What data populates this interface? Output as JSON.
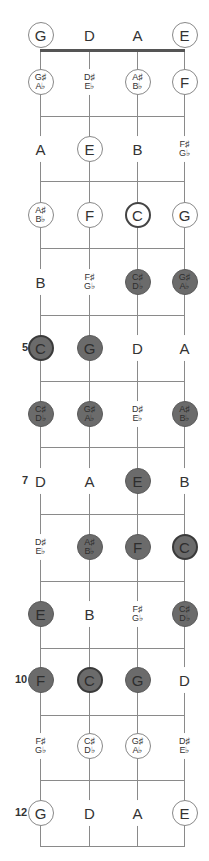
{
  "diagram": {
    "strings": [
      "G",
      "D",
      "A",
      "E"
    ],
    "string_x": [
      40,
      89,
      137,
      184
    ],
    "nut_y": 50,
    "fret_y": [
      116,
      181,
      248,
      315,
      381,
      447,
      514,
      581,
      648,
      715,
      780,
      846
    ],
    "row_y": [
      35,
      82,
      149,
      215,
      282,
      348,
      414,
      481,
      547,
      614,
      680,
      746,
      813
    ],
    "fret_numbers": [
      {
        "fret": 5,
        "label": "5"
      },
      {
        "fret": 7,
        "label": "7"
      },
      {
        "fret": 10,
        "label": "10"
      },
      {
        "fret": 12,
        "label": "12"
      }
    ],
    "colors": {
      "filled": "#6b6b6b",
      "line": "#8a8a8a",
      "nut": "#555555"
    },
    "rows": [
      [
        {
          "t": [
            "G"
          ],
          "s": "outline"
        },
        {
          "t": [
            "D"
          ],
          "s": "plain"
        },
        {
          "t": [
            "A"
          ],
          "s": "plain"
        },
        {
          "t": [
            "E"
          ],
          "s": "outline"
        }
      ],
      [
        {
          "t": [
            "G♯",
            "A♭"
          ],
          "s": "outline"
        },
        {
          "t": [
            "D♯",
            "E♭"
          ],
          "s": "plain"
        },
        {
          "t": [
            "A♯",
            "B♭"
          ],
          "s": "outline"
        },
        {
          "t": [
            "F"
          ],
          "s": "outline"
        }
      ],
      [
        {
          "t": [
            "A"
          ],
          "s": "plain"
        },
        {
          "t": [
            "E"
          ],
          "s": "outline"
        },
        {
          "t": [
            "B"
          ],
          "s": "plain"
        },
        {
          "t": [
            "F♯",
            "G♭"
          ],
          "s": "plain"
        }
      ],
      [
        {
          "t": [
            "A♯",
            "B♭"
          ],
          "s": "outline"
        },
        {
          "t": [
            "F"
          ],
          "s": "outline"
        },
        {
          "t": [
            "C"
          ],
          "s": "root-outline"
        },
        {
          "t": [
            "G"
          ],
          "s": "outline"
        }
      ],
      [
        {
          "t": [
            "B"
          ],
          "s": "plain"
        },
        {
          "t": [
            "F♯",
            "G♭"
          ],
          "s": "plain"
        },
        {
          "t": [
            "C♯",
            "D♭"
          ],
          "s": "filled"
        },
        {
          "t": [
            "G♯",
            "A♭"
          ],
          "s": "filled"
        }
      ],
      [
        {
          "t": [
            "C"
          ],
          "s": "filled root"
        },
        {
          "t": [
            "G"
          ],
          "s": "filled"
        },
        {
          "t": [
            "D"
          ],
          "s": "plain"
        },
        {
          "t": [
            "A"
          ],
          "s": "plain"
        }
      ],
      [
        {
          "t": [
            "C♯",
            "D♭"
          ],
          "s": "filled"
        },
        {
          "t": [
            "G♯",
            "A♭"
          ],
          "s": "filled"
        },
        {
          "t": [
            "D♯",
            "E♭"
          ],
          "s": "plain"
        },
        {
          "t": [
            "A♯",
            "B♭"
          ],
          "s": "filled"
        }
      ],
      [
        {
          "t": [
            "D"
          ],
          "s": "plain"
        },
        {
          "t": [
            "A"
          ],
          "s": "plain"
        },
        {
          "t": [
            "E"
          ],
          "s": "filled"
        },
        {
          "t": [
            "B"
          ],
          "s": "plain"
        }
      ],
      [
        {
          "t": [
            "D♯",
            "E♭"
          ],
          "s": "plain"
        },
        {
          "t": [
            "A♯",
            "B♭"
          ],
          "s": "filled"
        },
        {
          "t": [
            "F"
          ],
          "s": "filled"
        },
        {
          "t": [
            "C"
          ],
          "s": "filled root"
        }
      ],
      [
        {
          "t": [
            "E"
          ],
          "s": "filled"
        },
        {
          "t": [
            "B"
          ],
          "s": "plain"
        },
        {
          "t": [
            "F♯",
            "G♭"
          ],
          "s": "plain"
        },
        {
          "t": [
            "C♯",
            "D♭"
          ],
          "s": "filled"
        }
      ],
      [
        {
          "t": [
            "F"
          ],
          "s": "filled"
        },
        {
          "t": [
            "C"
          ],
          "s": "filled root"
        },
        {
          "t": [
            "G"
          ],
          "s": "filled"
        },
        {
          "t": [
            "D"
          ],
          "s": "plain"
        }
      ],
      [
        {
          "t": [
            "F♯",
            "G♭"
          ],
          "s": "plain"
        },
        {
          "t": [
            "C♯",
            "D♭"
          ],
          "s": "outline"
        },
        {
          "t": [
            "G♯",
            "A♭"
          ],
          "s": "outline"
        },
        {
          "t": [
            "D♯",
            "E♭"
          ],
          "s": "plain"
        }
      ],
      [
        {
          "t": [
            "G"
          ],
          "s": "outline"
        },
        {
          "t": [
            "D"
          ],
          "s": "plain"
        },
        {
          "t": [
            "A"
          ],
          "s": "plain"
        },
        {
          "t": [
            "E"
          ],
          "s": "outline"
        }
      ]
    ]
  }
}
